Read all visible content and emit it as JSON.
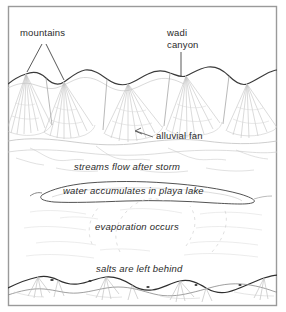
{
  "figure": {
    "frame_color": "#9a9a9a",
    "ink_color": "#2b2b2b",
    "hatch_color": "#b9b9b9",
    "faint_color": "#d2d2d2",
    "background": "#ffffff"
  },
  "labels": {
    "mountains": "mountains",
    "wadi": "wadi",
    "canyon": "canyon",
    "alluvial_fan": "alluvial fan",
    "streams": "streams flow after storm",
    "playa": "water accumulates in playa lake",
    "evaporation": "evaporation occurs",
    "salts": "salts are left behind"
  },
  "annotations": [
    {
      "name": "mountains",
      "text": "mountains",
      "style": "roman",
      "leader": "v-shaped double leader to two peaks"
    },
    {
      "name": "wadi-canyon",
      "text": "wadi canyon",
      "style": "roman",
      "leader": "vertical leader to ridge notch"
    },
    {
      "name": "alluvial-fan",
      "text": "alluvial fan",
      "style": "roman",
      "leader": "short arrow to fan apron"
    },
    {
      "name": "streams-flow",
      "text": "streams flow after storm",
      "style": "italic",
      "leader": "none"
    },
    {
      "name": "playa-lake",
      "text": "water accumulates in playa lake",
      "style": "italic",
      "leader": "none"
    },
    {
      "name": "evaporation",
      "text": "evaporation occurs",
      "style": "italic",
      "leader": "none"
    },
    {
      "name": "salts",
      "text": "salts are left behind",
      "style": "italic",
      "leader": "none"
    }
  ]
}
